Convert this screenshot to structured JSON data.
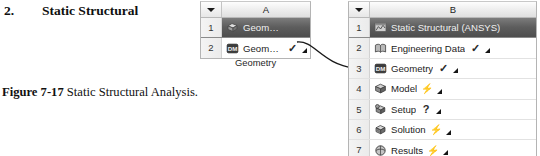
{
  "step": {
    "number": "2.",
    "title": "Static Structural"
  },
  "figure_caption": {
    "label": "Figure 7-17",
    "text": " Static Structural Analysis."
  },
  "system_a": {
    "column_letter": "A",
    "caption": "Geometry",
    "rows": [
      {
        "num": "1",
        "label": "Geometry",
        "icon": "geometry-block-icon",
        "status": "none",
        "is_title": true,
        "has_tab": false
      },
      {
        "num": "2",
        "label": "Geometry",
        "icon": "dm-geometry-icon",
        "status": "check",
        "is_title": false,
        "has_tab": true
      }
    ]
  },
  "system_b": {
    "column_letter": "B",
    "rows": [
      {
        "num": "1",
        "label": "Static Structural (ANSYS)",
        "icon": "static-structural-icon",
        "status": "none",
        "is_title": true,
        "has_tab": false
      },
      {
        "num": "2",
        "label": "Engineering Data",
        "icon": "engineering-data-icon",
        "status": "check",
        "is_title": false,
        "has_tab": true
      },
      {
        "num": "3",
        "label": "Geometry",
        "icon": "dm-geometry-icon",
        "status": "check",
        "is_title": false,
        "has_tab": true
      },
      {
        "num": "4",
        "label": "Model",
        "icon": "model-icon",
        "status": "bolt",
        "is_title": false,
        "has_tab": true
      },
      {
        "num": "5",
        "label": "Setup",
        "icon": "setup-icon",
        "status": "query",
        "is_title": false,
        "has_tab": true
      },
      {
        "num": "6",
        "label": "Solution",
        "icon": "solution-icon",
        "status": "bolt",
        "is_title": false,
        "has_tab": true
      },
      {
        "num": "7",
        "label": "Results",
        "icon": "results-icon",
        "status": "bolt",
        "is_title": false,
        "has_tab": true
      }
    ]
  },
  "colors": {
    "title_row_bg": "#5d5d5d",
    "title_row_text": "#f2f2f2",
    "grid_line": "#e2e2e2",
    "border": "#b4b4b4",
    "link_node": "#111111"
  }
}
